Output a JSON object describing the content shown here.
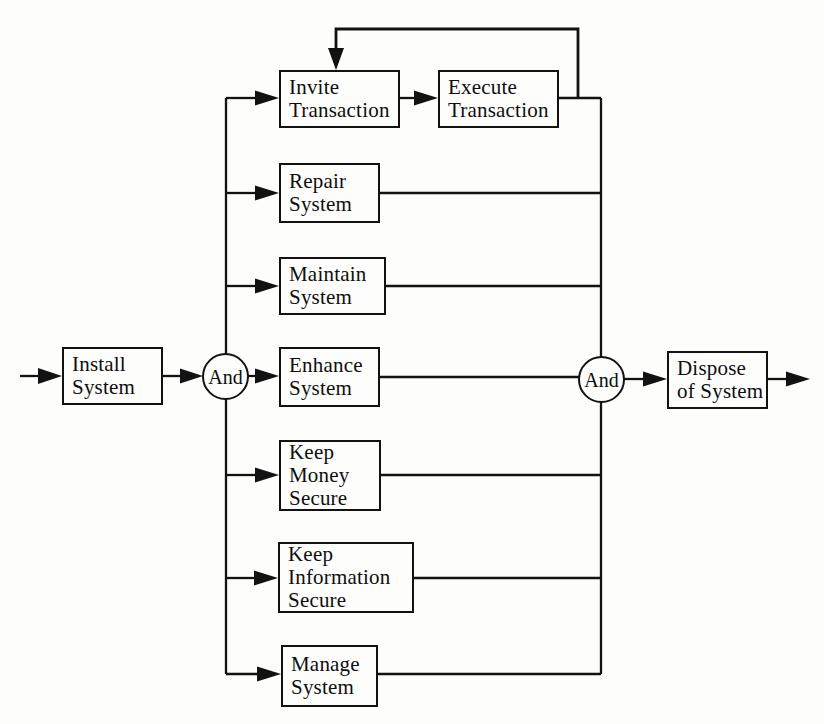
{
  "diagram": {
    "type": "function-decomposition-flow",
    "colors": {
      "background": "#fdfdfc",
      "line": "#121212",
      "box_fill": "#fdfdfc",
      "text": "#0e0e0e"
    },
    "nodes": {
      "install": {
        "label": "Install\nSystem"
      },
      "invite": {
        "label": "Invite\nTransaction"
      },
      "execute": {
        "label": "Execute\nTransaction"
      },
      "repair": {
        "label": "Repair\nSystem"
      },
      "maintain": {
        "label": "Maintain\nSystem"
      },
      "enhance": {
        "label": "Enhance\nSystem"
      },
      "keep_money": {
        "label": "Keep\nMoney\nSecure"
      },
      "keep_info": {
        "label": "Keep\nInformation\nSecure"
      },
      "manage": {
        "label": "Manage\nSystem"
      },
      "dispose": {
        "label": "Dispose\nof System"
      }
    },
    "gates": {
      "split": {
        "label": "And"
      },
      "join": {
        "label": "And"
      }
    },
    "edges": [
      {
        "from": "start",
        "to": "install"
      },
      {
        "from": "install",
        "to": "and_split"
      },
      {
        "from": "and_split",
        "to": "invite"
      },
      {
        "from": "and_split",
        "to": "repair"
      },
      {
        "from": "and_split",
        "to": "maintain"
      },
      {
        "from": "and_split",
        "to": "enhance"
      },
      {
        "from": "and_split",
        "to": "keep_money"
      },
      {
        "from": "and_split",
        "to": "keep_info"
      },
      {
        "from": "and_split",
        "to": "manage"
      },
      {
        "from": "invite",
        "to": "execute"
      },
      {
        "from": "execute",
        "to": "invite",
        "note": "feedback loop"
      },
      {
        "from": "execute",
        "to": "and_join"
      },
      {
        "from": "repair",
        "to": "and_join"
      },
      {
        "from": "maintain",
        "to": "and_join"
      },
      {
        "from": "enhance",
        "to": "and_join"
      },
      {
        "from": "keep_money",
        "to": "and_join"
      },
      {
        "from": "keep_info",
        "to": "and_join"
      },
      {
        "from": "manage",
        "to": "and_join"
      },
      {
        "from": "and_join",
        "to": "dispose"
      },
      {
        "from": "dispose",
        "to": "end"
      }
    ]
  }
}
